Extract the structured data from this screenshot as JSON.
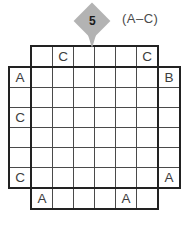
{
  "puzzle": {
    "number": "5",
    "range_label": "(A–C)",
    "grid_size": 6,
    "top_clues": [
      "",
      "C",
      "",
      "",
      "",
      "C"
    ],
    "left_clues": [
      "A",
      "",
      "C",
      "",
      "",
      "C"
    ],
    "right_clues": [
      "B",
      "",
      "",
      "",
      "",
      "A"
    ],
    "bottom_clues": [
      "A",
      "",
      "",
      "",
      "A",
      ""
    ],
    "grid_rows": [
      [
        "",
        "",
        "",
        "",
        "",
        ""
      ],
      [
        "",
        "",
        "",
        "",
        "",
        ""
      ],
      [
        "",
        "",
        "",
        "",
        "",
        ""
      ],
      [
        "",
        "",
        "",
        "",
        "",
        ""
      ],
      [
        "",
        "",
        "",
        "",
        "",
        ""
      ],
      [
        "",
        "",
        "",
        "",
        "",
        ""
      ]
    ]
  },
  "colors": {
    "background": "#ffffff",
    "diamond_fill": "#b3b3b3",
    "thick_border": "#222222",
    "thin_line": "#4a4a4a",
    "letter": "#3d3d3d",
    "number": "#1a1a1a",
    "label": "#4a4a4a"
  }
}
